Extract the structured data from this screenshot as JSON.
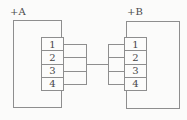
{
  "diagram": {
    "connectors": [
      {
        "label": "+A",
        "pins": [
          "1",
          "2",
          "3",
          "4"
        ]
      },
      {
        "label": "+B",
        "pins": [
          "1",
          "2",
          "3",
          "4"
        ]
      }
    ],
    "colors": {
      "line": "#8e8e8e",
      "text": "#474747",
      "background": "#fbfbfa"
    }
  }
}
